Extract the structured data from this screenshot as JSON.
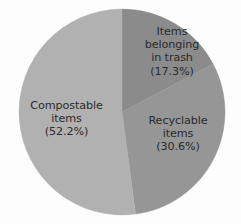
{
  "chart_data": {
    "type": "pie",
    "title": "",
    "subtitle": "",
    "xlabel": "",
    "ylabel": "",
    "legend_position": "none",
    "grid": false,
    "start_angle_deg": 0,
    "direction": "clockwise",
    "categories": [
      "Items belonging in trash",
      "Recyclable items",
      "Compostable items"
    ],
    "values": [
      17.3,
      30.6,
      52.2
    ],
    "value_unit": "%",
    "colors": [
      "#8b8b8b",
      "#969696",
      "#b1b1b1"
    ],
    "slices": [
      {
        "name": "items-belonging-in-trash",
        "label_lines": [
          "Items",
          "belonging",
          "in trash",
          "(17.3%)"
        ],
        "value": 17.3,
        "percent_text": "(17.3%)",
        "color": "#8b8b8b",
        "start_deg": 0,
        "end_deg": 62.28
      },
      {
        "name": "recyclable-items",
        "label_lines": [
          "Recyclable",
          "items",
          "(30.6%)"
        ],
        "value": 30.6,
        "percent_text": "(30.6%)",
        "color": "#969696",
        "start_deg": 62.28,
        "end_deg": 172.44
      },
      {
        "name": "compostable-items",
        "label_lines": [
          "Compostable",
          "items",
          "(52.2%)"
        ],
        "value": 52.2,
        "percent_text": "(52.2%)",
        "color": "#b1b1b1",
        "start_deg": 172.44,
        "end_deg": 360
      }
    ],
    "background_color": "#fdfdfd",
    "label_text_color": "#2b2b2b",
    "geometry": {
      "center_x": 122,
      "center_y": 112,
      "radius": 103
    }
  },
  "labels": {
    "trash": {
      "line1": "Items",
      "line2": "belonging",
      "line3": "in trash",
      "line4": "(17.3%)"
    },
    "recyclable": {
      "line1": "Recyclable",
      "line2": "items",
      "line3": "(30.6%)"
    },
    "compostable": {
      "line1": "Compostable",
      "line2": "items",
      "line3": "(52.2%)"
    }
  }
}
